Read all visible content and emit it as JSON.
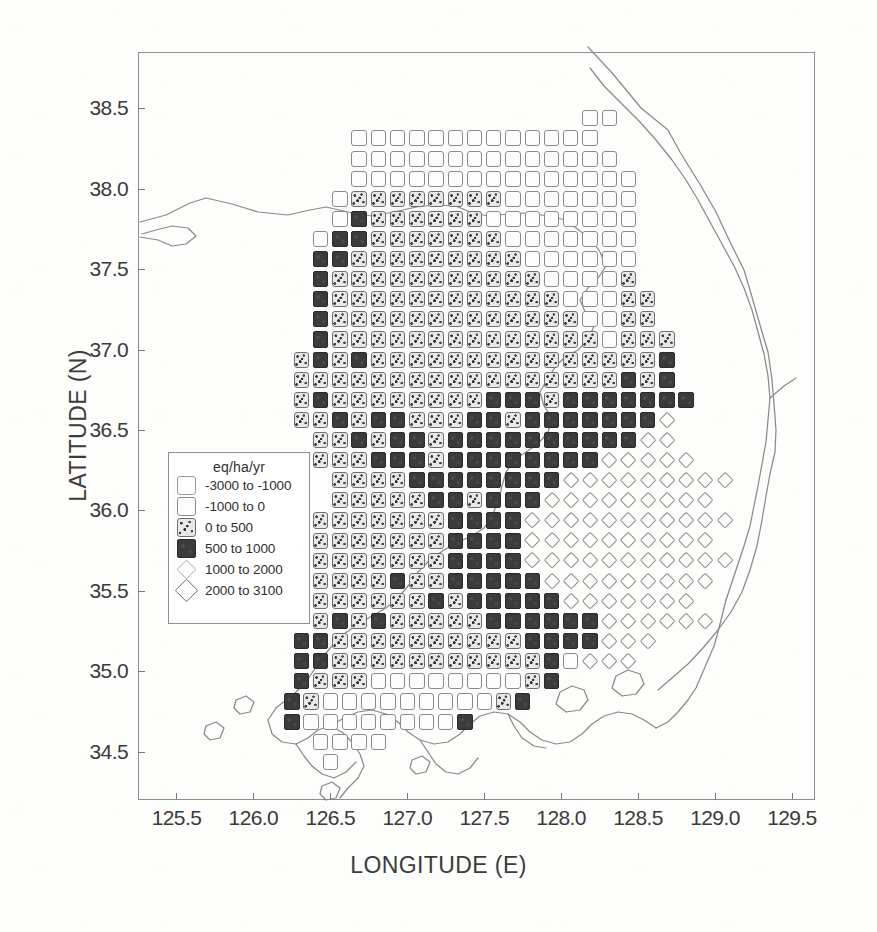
{
  "figure": {
    "x_axis_title": "LONGITUDE (E)",
    "y_axis_title": "LATITUDE (N)"
  },
  "legend": {
    "title": "eq/ha/yr",
    "items": [
      {
        "label": "-3000 to -1000",
        "symbol": "open-square-light",
        "class": "c1"
      },
      {
        "label": "-1000 to 0",
        "symbol": "open-square",
        "class": "c2"
      },
      {
        "label": "0 to 500",
        "symbol": "stippled-square",
        "class": "c3"
      },
      {
        "label": "500 to 1000",
        "symbol": "solid-square",
        "class": "c4"
      },
      {
        "label": "1000 to 2000",
        "symbol": "small-diamond",
        "class": "c5"
      },
      {
        "label": "2000 to 3100",
        "symbol": "large-diamond",
        "class": "c6"
      }
    ]
  },
  "chart_data": {
    "type": "heatmap",
    "title": "",
    "xlabel": "LONGITUDE (E)",
    "ylabel": "LATITUDE (N)",
    "xlim": [
      125.25,
      129.65
    ],
    "ylim": [
      34.2,
      38.85
    ],
    "xticks": [
      125.5,
      126.0,
      126.5,
      127.0,
      127.5,
      128.0,
      128.5,
      129.0,
      129.5
    ],
    "xtick_labels": [
      "125.5",
      "126.0",
      "126.5",
      "127.0",
      "127.5",
      "128.0",
      "128.5",
      "129.0",
      "129.5"
    ],
    "yticks": [
      34.5,
      35.0,
      35.5,
      36.0,
      36.5,
      37.0,
      37.5,
      38.0,
      38.5
    ],
    "ytick_labels": [
      "34.5",
      "35.0",
      "35.5",
      "36.0",
      "36.5",
      "37.0",
      "37.5",
      "38.0",
      "38.5"
    ],
    "grid": false,
    "legend_position": "inner-left",
    "cell_size_deg": 0.125,
    "value_unit": "eq/ha/yr",
    "classes": [
      {
        "id": 1,
        "range": [
          -3000,
          -1000
        ]
      },
      {
        "id": 2,
        "range": [
          -1000,
          0
        ]
      },
      {
        "id": 3,
        "range": [
          0,
          500
        ]
      },
      {
        "id": 4,
        "range": [
          500,
          1000
        ]
      },
      {
        "id": 5,
        "range": [
          1000,
          2000
        ]
      },
      {
        "id": 6,
        "range": [
          2000,
          3100
        ]
      }
    ],
    "rows": [
      {
        "lat": 38.4375,
        "lon0": 128.1875,
        "codes": "22"
      },
      {
        "lat": 38.3125,
        "lon0": 126.6875,
        "codes": "2222222222222"
      },
      {
        "lat": 38.1875,
        "lon0": 126.6875,
        "codes": "22222222222222"
      },
      {
        "lat": 38.0625,
        "lon0": 126.6875,
        "codes": "222222222222222"
      },
      {
        "lat": 37.9375,
        "lon0": 126.5625,
        "codes": "2333333332222222"
      },
      {
        "lat": 37.8125,
        "lon0": 126.5625,
        "codes": "2433333322222222"
      },
      {
        "lat": 37.6875,
        "lon0": 126.4375,
        "codes": "24433333332222222"
      },
      {
        "lat": 37.5625,
        "lon0": 126.4375,
        "codes": "44333333333222222"
      },
      {
        "lat": 37.4375,
        "lon0": 126.4375,
        "codes": "43333333333322223"
      },
      {
        "lat": 37.3125,
        "lon0": 126.4375,
        "codes": "433333333333322233"
      },
      {
        "lat": 37.1875,
        "lon0": 126.4375,
        "codes": "433333333333332233"
      },
      {
        "lat": 37.0625,
        "lon0": 126.4375,
        "codes": "4333333333333332333"
      },
      {
        "lat": 36.9375,
        "lon0": 126.3125,
        "codes": "34343333333333333334"
      },
      {
        "lat": 36.8125,
        "lon0": 126.3125,
        "codes": "33333333333333333434"
      },
      {
        "lat": 36.6875,
        "lon0": 126.3125,
        "codes": "343333333344434444444"
      },
      {
        "lat": 36.5625,
        "lon0": 126.3125,
        "codes": "33434433344344444445"
      },
      {
        "lat": 36.4375,
        "lon0": 126.4375,
        "codes": "3343443444444444455"
      },
      {
        "lat": 36.3125,
        "lon0": 126.4375,
        "codes": "33344434444444455555"
      },
      {
        "lat": 36.1875,
        "lon0": 126.5625,
        "codes": "333344444444555555555"
      },
      {
        "lat": 36.0625,
        "lon0": 126.5625,
        "codes": "33333443444555555555"
      },
      {
        "lat": 35.9375,
        "lon0": 126.4375,
        "codes": "3333333444455555555555"
      },
      {
        "lat": 35.8125,
        "lon0": 126.4375,
        "codes": "333333344445555555555"
      },
      {
        "lat": 35.6875,
        "lon0": 126.4375,
        "codes": "3333333444455555555555"
      },
      {
        "lat": 35.5625,
        "lon0": 126.4375,
        "codes": "333343344444555555555"
      },
      {
        "lat": 35.4375,
        "lon0": 126.4375,
        "codes": "33333343444445555555"
      },
      {
        "lat": 35.3125,
        "lon0": 126.4375,
        "codes": "343433333444444555555"
      },
      {
        "lat": 35.1875,
        "lon0": 126.3125,
        "codes": "4433333333334444555"
      },
      {
        "lat": 35.0625,
        "lon0": 126.3125,
        "codes": "443333333333342555"
      },
      {
        "lat": 34.9375,
        "lon0": 126.3125,
        "codes": "43332222222234"
      },
      {
        "lat": 34.8125,
        "lon0": 126.25,
        "codes": "4322222222234"
      },
      {
        "lat": 34.6875,
        "lon0": 126.25,
        "codes": "4222222224"
      },
      {
        "lat": 34.5625,
        "lon0": 126.4375,
        "codes": "2222"
      },
      {
        "lat": 34.4375,
        "lon0": 126.5,
        "codes": "2"
      }
    ]
  }
}
